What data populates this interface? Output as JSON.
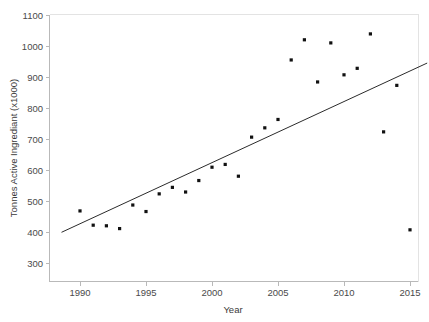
{
  "chart_data": {
    "type": "scatter",
    "title": "",
    "xlabel": "Year",
    "ylabel": "Tonnes Active Ingrediant (x1000)",
    "xlim": [
      1988.5,
      2016.5
    ],
    "ylim": [
      265,
      1110
    ],
    "grid": false,
    "legend": null,
    "xticks": [
      1990,
      1995,
      2000,
      2005,
      2010,
      2015
    ],
    "yticks": [
      300,
      400,
      500,
      600,
      700,
      800,
      900,
      1000,
      1100
    ],
    "x": [
      1990,
      1991,
      1992,
      1993,
      1994,
      1995,
      1996,
      1997,
      1998,
      1999,
      2000,
      2001,
      2002,
      2003,
      2004,
      2005,
      2006,
      2007,
      2008,
      2009,
      2010,
      2011,
      2012,
      2013,
      2014,
      2015
    ],
    "values": [
      468,
      422,
      420,
      411,
      487,
      466,
      523,
      544,
      529,
      566,
      609,
      618,
      580,
      706,
      736,
      763,
      955,
      1020,
      884,
      1010,
      907,
      928,
      1039,
      723,
      873,
      407
    ],
    "series": [
      {
        "name": "Tonnes Active Ingrediant",
        "marker": "square",
        "color": "#111111",
        "values": [
          468,
          422,
          420,
          411,
          487,
          466,
          523,
          544,
          529,
          566,
          609,
          618,
          580,
          706,
          736,
          763,
          955,
          1020,
          884,
          1010,
          907,
          928,
          1039,
          723,
          873,
          407
        ]
      }
    ],
    "trend_line": {
      "name": "linear-fit",
      "color": "#2b2b2b",
      "x_start": 1988.6,
      "y_start": 399,
      "x_end": 2016.3,
      "y_end": 945
    }
  },
  "axes": {
    "y_title": "Tonnes Active Ingrediant (x1000)",
    "x_title": "Year",
    "y_tick_labels": [
      "1100",
      "1000",
      "900",
      "800",
      "700",
      "600",
      "500",
      "400",
      "300"
    ],
    "x_tick_labels": [
      "1990",
      "1995",
      "2000",
      "2005",
      "2010",
      "2015"
    ]
  },
  "colors": {
    "background": "#ffffff",
    "axis": "#b9b9b9",
    "marker": "#111111",
    "trend": "#2b2b2b",
    "text": "#3a3a3a"
  }
}
